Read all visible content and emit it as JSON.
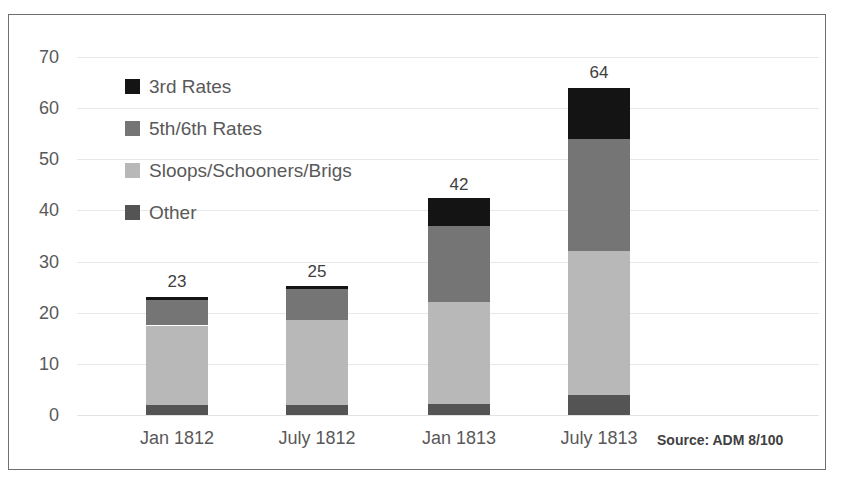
{
  "chart_data": {
    "type": "bar",
    "variant": "stacked-vertical",
    "title": "",
    "subtitle": "",
    "xlabel": "",
    "ylabel": "",
    "categories": [
      "Jan 1812",
      "July 1812",
      "Jan 1813",
      "July 1813"
    ],
    "series": [
      {
        "name": "Other",
        "values": [
          2,
          2,
          2.2,
          4
        ],
        "color": "#545454"
      },
      {
        "name": "Sloops/Schooners/Brigs",
        "values": [
          15.5,
          16.5,
          19.8,
          28
        ],
        "color": "#b8b8b8"
      },
      {
        "name": "5th/6th Rates",
        "values": [
          5,
          6.2,
          15,
          22
        ],
        "color": "#757575"
      },
      {
        "name": "3rd Rates",
        "values": [
          0.5,
          0.5,
          5.5,
          10
        ],
        "color": "#141414"
      }
    ],
    "totals": [
      23,
      25,
      42,
      64
    ],
    "total_labels": [
      "23",
      "25",
      "42",
      "64"
    ],
    "ylim": [
      0,
      70
    ],
    "yticks": [
      0,
      10,
      20,
      30,
      40,
      50,
      60,
      70
    ],
    "ytick_labels": [
      "0",
      "10",
      "20",
      "30",
      "40",
      "50",
      "60",
      "70"
    ],
    "grid": true,
    "legend_position": "inside-upper-left",
    "legend": [
      {
        "label": "3rd Rates",
        "color": "#141414"
      },
      {
        "label": "5th/6th Rates",
        "color": "#757575"
      },
      {
        "label": "Sloops/Schooners/Brigs",
        "color": "#b8b8b8"
      },
      {
        "label": "Other",
        "color": "#545454"
      }
    ],
    "annotations": [
      {
        "name": "source-note",
        "text": "Source: ADM 8/100"
      }
    ]
  },
  "source_note": "Source: ADM 8/100"
}
